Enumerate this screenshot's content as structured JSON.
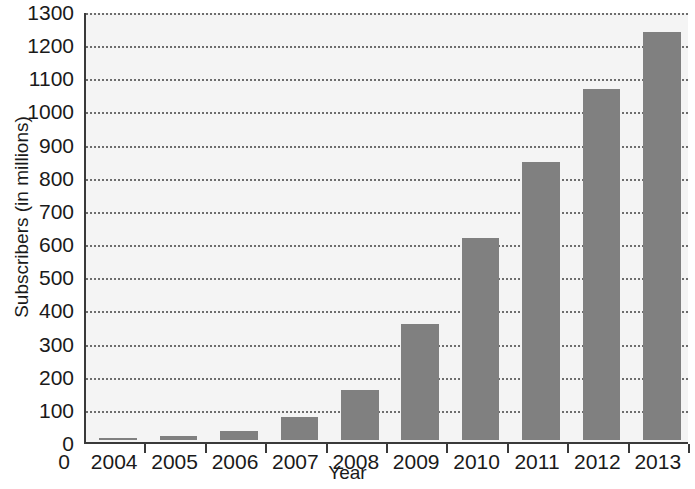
{
  "chart_data": {
    "type": "bar",
    "title": "",
    "xlabel": "Year",
    "ylabel": "Subscribers (in millions)",
    "categories": [
      "2004",
      "2005",
      "2006",
      "2007",
      "2008",
      "2009",
      "2010",
      "2011",
      "2012",
      "2013"
    ],
    "values": [
      5,
      12,
      27,
      70,
      150,
      350,
      610,
      840,
      1060,
      1230
    ],
    "series": [
      {
        "name": "Subscribers",
        "values": [
          5,
          12,
          27,
          70,
          150,
          350,
          610,
          840,
          1060,
          1230
        ]
      }
    ],
    "ylim": [
      0,
      1300
    ],
    "y_ticks": [
      0,
      100,
      200,
      300,
      400,
      500,
      600,
      700,
      800,
      900,
      1000,
      1100,
      1200,
      1300
    ],
    "y_ticklabels": [
      "0",
      "100",
      "200",
      "300",
      "400",
      "500",
      "600",
      "700",
      "800",
      "900",
      "1000",
      "1100",
      "1200",
      "1300"
    ],
    "x_origin_label": "0",
    "grid": true,
    "grid_style": "dotted-horizontal",
    "legend": "none",
    "bar_color": "#808080",
    "plot_background": "#f4f4f4",
    "axis_color": "#3a3a3a",
    "gridline_color": "#6d6d6d",
    "text_color": "#1a1a1a"
  }
}
